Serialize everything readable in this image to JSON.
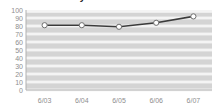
{
  "window": {
    "title": "Preference history",
    "title_rule_color": "#9a9a9a"
  },
  "chart_data": {
    "type": "line",
    "title": "Preference history",
    "xlabel": "",
    "ylabel": "",
    "categories": [
      "6/03",
      "6/04",
      "6/05",
      "6/06",
      "6/07"
    ],
    "values": [
      81,
      81,
      79,
      84,
      92
    ],
    "ylim": [
      0,
      100
    ],
    "ytick_labels": [
      "100",
      "90",
      "80",
      "70",
      "60",
      "50",
      "40",
      "30",
      "20",
      "10",
      "0"
    ],
    "ytick_values": [
      100,
      90,
      80,
      70,
      60,
      50,
      40,
      30,
      20,
      10,
      0
    ],
    "grid": true,
    "legend": "none",
    "series": [
      {
        "name": "series-1",
        "values": [
          81,
          81,
          79,
          84,
          92
        ],
        "line_color": "#3b3b3b",
        "marker_fill": "#ffffff",
        "marker_edge": "#6e6e6e",
        "marker": "circle"
      }
    ],
    "plot_background": "#d4d4d4",
    "gridline_color": "#f4f4f4",
    "axis_color": "#b0b0b0",
    "tick_label_color": "#8e8e8e"
  }
}
